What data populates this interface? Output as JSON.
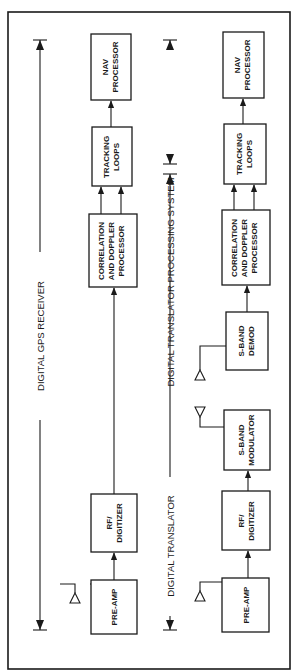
{
  "diagram": {
    "orientation": "rotated 90 degrees counter-clockwise",
    "colors": {
      "ink": "#1a1a1a",
      "background": "#ffffff"
    },
    "spans": [
      {
        "id": "gps",
        "label": "DIGITAL GPS RECEIVER"
      },
      {
        "id": "translator",
        "label": "DIGITAL TRANSLATOR"
      },
      {
        "id": "processing",
        "label": "DIGITAL TRANSLATOR PROCESSING SYSTEM"
      }
    ],
    "top_row": {
      "name": "Digital GPS Receiver chain",
      "blocks": [
        {
          "id": "preamp",
          "lines": [
            "PRE-AMP"
          ]
        },
        {
          "id": "rf",
          "lines": [
            "RF/",
            "DIGITIZER"
          ]
        },
        {
          "id": "corr",
          "lines": [
            "CORRELATION",
            "AND DOPPLER",
            "PROCESSOR"
          ]
        },
        {
          "id": "track",
          "lines": [
            "TRACKING",
            "LOOPS"
          ]
        },
        {
          "id": "nav",
          "lines": [
            "NAV",
            "PROCESSOR"
          ]
        }
      ]
    },
    "bottom_row": {
      "name": "Digital Translator chain",
      "blocks": [
        {
          "id": "preamp",
          "lines": [
            "PRE-AMP"
          ]
        },
        {
          "id": "rf",
          "lines": [
            "RF/",
            "DIGITIZER"
          ]
        },
        {
          "id": "smod",
          "lines": [
            "S-BAND",
            "MODULATOR"
          ]
        },
        {
          "id": "sdemod",
          "lines": [
            "S-BAND",
            "DEMOD"
          ]
        },
        {
          "id": "corr",
          "lines": [
            "CORRELATION",
            "AND DOPPLER",
            "PROCESSOR"
          ]
        },
        {
          "id": "track",
          "lines": [
            "TRACKING",
            "LOOPS"
          ]
        },
        {
          "id": "nav",
          "lines": [
            "NAV",
            "PROCESSOR"
          ]
        }
      ]
    }
  }
}
